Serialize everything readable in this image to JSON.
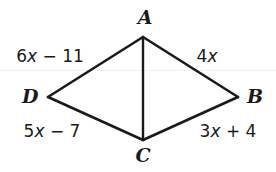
{
  "figure": {
    "type": "quadrilateral-with-diagonal",
    "background_color": "#ffffff",
    "line_color": "#1a1a1a",
    "vertices": [
      {
        "name": "A",
        "label": "A",
        "x": 143,
        "y": 37,
        "label_x": 145,
        "label_y": 18
      },
      {
        "name": "B",
        "label": "B",
        "x": 238,
        "y": 97,
        "label_x": 252,
        "label_y": 96
      },
      {
        "name": "C",
        "label": "C",
        "x": 143,
        "y": 140,
        "label_x": 143,
        "label_y": 155
      },
      {
        "name": "D",
        "label": "D",
        "x": 48,
        "y": 97,
        "label_x": 30,
        "label_y": 96
      }
    ],
    "edges": [
      {
        "name": "side-DA",
        "from": "D",
        "to": "A"
      },
      {
        "name": "side-AB",
        "from": "A",
        "to": "B"
      },
      {
        "name": "side-BC",
        "from": "B",
        "to": "C"
      },
      {
        "name": "side-CD",
        "from": "C",
        "to": "D"
      },
      {
        "name": "diagonal-AC",
        "from": "A",
        "to": "C"
      }
    ],
    "side_labels": [
      {
        "name": "label-DA",
        "coefficient": "6",
        "variable": "x",
        "operator": "−",
        "constant": "11",
        "text": "6x − 11",
        "x": 50,
        "y": 57
      },
      {
        "name": "label-AB",
        "coefficient": "4",
        "variable": "x",
        "operator": "",
        "constant": "",
        "text": "4x",
        "x": 207,
        "y": 57
      },
      {
        "name": "label-CD",
        "coefficient": "5",
        "variable": "x",
        "operator": "−",
        "constant": "7",
        "text": "5x − 7",
        "x": 52,
        "y": 132
      },
      {
        "name": "label-BC",
        "coefficient": "3",
        "variable": "x",
        "operator": "+",
        "constant": "4",
        "text": "3x + 4",
        "x": 228,
        "y": 132
      }
    ]
  }
}
